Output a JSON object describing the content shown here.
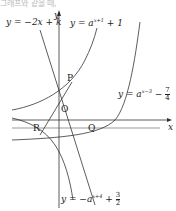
{
  "header_text": "그래프와 같을 때,",
  "axes": {
    "x_label": "x",
    "y_label": "y",
    "origin_label": "O"
  },
  "points": {
    "P": "P",
    "Q": "Q",
    "R": "R"
  },
  "curves": {
    "line": {
      "lhs": "y = −2x + k"
    },
    "curve1": {
      "lhs": "y = a",
      "exp": "x+1",
      "rhs": " + 1"
    },
    "curve2": {
      "lhs": "y = a",
      "exp": "x−3",
      "rhs": " −",
      "num": "7",
      "den": "4"
    },
    "curve3": {
      "lhs": "y = −a",
      "exp": "x+4",
      "rhs": " +",
      "num": "3",
      "den": "2"
    }
  }
}
